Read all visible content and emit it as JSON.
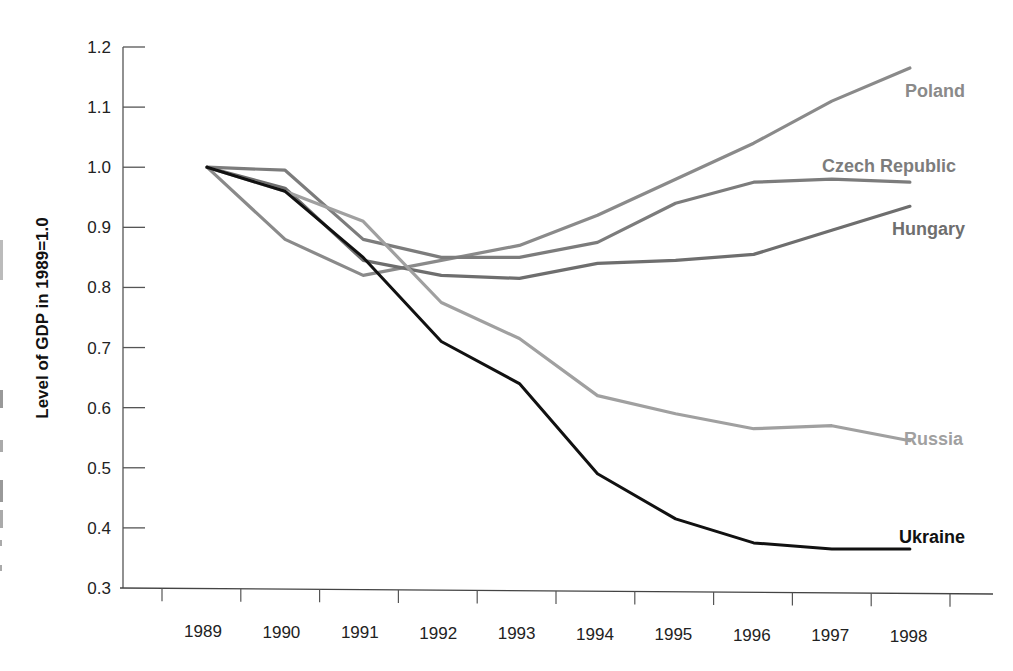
{
  "chart_data": {
    "type": "line",
    "title": "",
    "xlabel": "",
    "ylabel": "Level of GDP in 1989=1.0",
    "ylim": [
      0.3,
      1.2
    ],
    "yticks": [
      "0.3",
      "0.4",
      "0.5",
      "0.6",
      "0.7",
      "0.8",
      "0.9",
      "1.0",
      "1.1",
      "1.2"
    ],
    "grid": false,
    "legend_position": "inline-right-labels",
    "x": [
      "1989",
      "1990",
      "1991",
      "1992",
      "1993",
      "1994",
      "1995",
      "1996",
      "1997",
      "1998"
    ],
    "series": [
      {
        "name": "Poland",
        "color": "#8a8a8a",
        "values": [
          1.0,
          0.88,
          0.82,
          0.845,
          0.87,
          0.92,
          0.98,
          1.04,
          1.11,
          1.165
        ]
      },
      {
        "name": "Czech Republic",
        "color": "#7c7c7c",
        "values": [
          1.0,
          0.995,
          0.88,
          0.85,
          0.85,
          0.875,
          0.94,
          0.975,
          0.98,
          0.975
        ]
      },
      {
        "name": "Hungary",
        "color": "#6e6e6e",
        "values": [
          1.0,
          0.965,
          0.845,
          0.82,
          0.815,
          0.84,
          0.845,
          0.855,
          0.895,
          0.935
        ]
      },
      {
        "name": "Russia",
        "color": "#a0a0a0",
        "values": [
          1.0,
          0.96,
          0.91,
          0.775,
          0.715,
          0.62,
          0.59,
          0.565,
          0.57,
          0.545
        ]
      },
      {
        "name": "Ukraine",
        "color": "#111111",
        "values": [
          1.0,
          0.96,
          0.85,
          0.71,
          0.64,
          0.49,
          0.415,
          0.375,
          0.365,
          0.365
        ]
      }
    ]
  },
  "labels": {
    "ylabel": "Level of GDP in 1989=1.0",
    "poland": "Poland",
    "czech": "Czech Republic",
    "hungary": "Hungary",
    "russia": "Russia",
    "ukraine": "Ukraine"
  }
}
